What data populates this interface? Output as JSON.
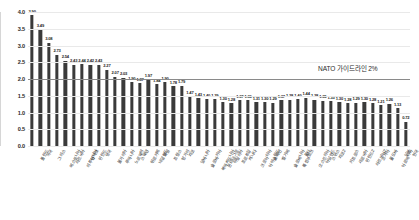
{
  "chart_data": {
    "type": "bar",
    "title": "",
    "subtitle": "",
    "xlabel": "",
    "ylabel": "",
    "ylim": [
      0.0,
      4.0
    ],
    "ytick_labels": [
      "0.0",
      "0.5",
      "1.0",
      "1.5",
      "2.0",
      "2.5",
      "3.0",
      "3.5",
      "4.0"
    ],
    "ytick_values": [
      0.0,
      0.5,
      1.0,
      1.5,
      2.0,
      2.5,
      3.0,
      3.5,
      4.0
    ],
    "grid": true,
    "legend": "none",
    "orientation": "vertical",
    "bar_color": "#3a3a3a",
    "categories": [
      "폴란드",
      "미국",
      "그리스",
      "에스토니아",
      "라트비아",
      "리투아니아",
      "덴마크",
      "핀란드",
      "영국",
      "불가리아",
      "루마니아",
      "노르웨이",
      "스웨덴",
      "튀르키예",
      "네덜란드",
      "독일",
      "프랑스",
      "헝가리",
      "체코",
      "알바니아",
      "슬로바키아",
      "북마케도니아",
      "몬테네그로",
      "이탈리아",
      "포르투갈",
      "캐나다",
      "크로아티아",
      "아이슬란드",
      "스페인",
      "벨기에",
      "슬로베니아",
      "룩셈부르크",
      "몰타",
      "오스트리아",
      "아일랜드",
      "스위스",
      "체코2",
      "키프로스",
      "세르비아",
      "핀란드2",
      "라트비아2",
      "조지아",
      "몰도바",
      "아르메니아",
      "일본",
      "한국"
    ],
    "values": [
      3.9,
      3.49,
      3.08,
      2.73,
      2.54,
      2.43,
      2.44,
      2.42,
      2.43,
      2.27,
      2.07,
      2.03,
      1.9,
      1.87,
      1.97,
      1.84,
      1.9,
      1.78,
      1.79,
      1.47,
      1.43,
      1.4,
      1.39,
      1.3,
      1.28,
      1.37,
      1.36,
      1.31,
      1.3,
      1.29,
      1.37,
      1.38,
      1.4,
      1.44,
      1.38,
      1.35,
      1.33,
      1.3,
      1.28,
      1.29,
      1.3,
      1.28,
      1.21,
      1.26,
      1.13,
      0.72
    ],
    "value_labels": [
      "3.90",
      "3.49",
      "3.08",
      "2.73",
      "2.54",
      "2.43",
      "2.44",
      "2.42",
      "2.43",
      "2.27",
      "2.07",
      "2.03",
      "1.90",
      "1.87",
      "1.97",
      "1.84",
      "1.90",
      "1.78",
      "1.79",
      "1.47",
      "1.43",
      "1.40",
      "1.39",
      "1.30",
      "1.28",
      "1.37",
      "1.36",
      "1.31",
      "1.30",
      "1.29",
      "1.37",
      "1.38",
      "1.40",
      "1.44",
      "1.38",
      "1.35",
      "1.33",
      "1.30",
      "1.28",
      "1.29",
      "1.30",
      "1.28",
      "1.21",
      "1.26",
      "1.13",
      "0.72"
    ],
    "annotations": [
      {
        "name": "nato-guideline",
        "text": "NATO 가이드라인 2%",
        "value": 2.0,
        "color": "#8a8a8a",
        "style": "horizontal-line"
      }
    ]
  }
}
